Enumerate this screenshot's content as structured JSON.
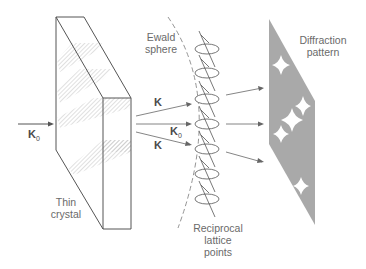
{
  "diagram": {
    "labels": {
      "ewald": "Ewald\nsphere",
      "diffraction": "Diffraction\npattern",
      "crystal": "Thin\ncrystal",
      "reciprocal": "Reciprocal\nlattice\npoints"
    },
    "vectors": {
      "incident": "K",
      "incident_sub": "0",
      "upper": "K",
      "middle": "K",
      "middle_sub": "0",
      "lower": "K"
    },
    "colors": {
      "line": "#555555",
      "pattern_fill": "#a9a9a9",
      "spot": "#ffffff",
      "text": "#6a6a6a"
    },
    "reciprocal_points_count": 7,
    "diffraction_spots_count": 5
  }
}
